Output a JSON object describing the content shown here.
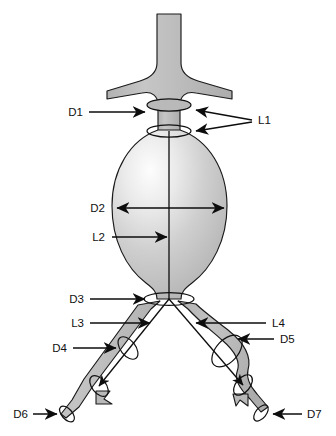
{
  "figure": {
    "background_color": "#ffffff",
    "vessel_fill_color": "#b9b9b9",
    "vessel_outline_color": "#1a1a1a",
    "highlight_color": "#fdfdfd",
    "annotation_color": "#0d0d0d"
  },
  "labels": {
    "d1": "D1",
    "d2": "D2",
    "d3": "D3",
    "d4": "D4",
    "d5": "D5",
    "d6": "D6",
    "d7": "D7",
    "l1": "L1",
    "l2": "L2",
    "l3": "L3",
    "l4": "L4"
  },
  "annotations": [
    {
      "id": "D1",
      "kind": "diameter",
      "arrow": "single",
      "direction": "right",
      "target": "proximal-aortic-neck"
    },
    {
      "id": "L1",
      "kind": "length",
      "arrow": "double-branch",
      "direction": "left",
      "target": "aortic-neck-segment"
    },
    {
      "id": "D2",
      "kind": "diameter",
      "arrow": "double",
      "direction": "horizontal",
      "target": "aneurysm-sac-max-diameter"
    },
    {
      "id": "L2",
      "kind": "length",
      "arrow": "single",
      "direction": "right",
      "target": "aneurysm-sac-centerline"
    },
    {
      "id": "D3",
      "kind": "diameter",
      "arrow": "single",
      "direction": "right",
      "target": "distal-aortic-bifurcation"
    },
    {
      "id": "L3",
      "kind": "length",
      "arrow": "single",
      "direction": "right",
      "target": "left-iliac-limb-length"
    },
    {
      "id": "L4",
      "kind": "length",
      "arrow": "single",
      "direction": "left",
      "target": "right-iliac-limb-length"
    },
    {
      "id": "D4",
      "kind": "diameter",
      "arrow": "single",
      "direction": "right",
      "target": "left-common-iliac-artery"
    },
    {
      "id": "D5",
      "kind": "diameter",
      "arrow": "single",
      "direction": "left",
      "target": "right-common-iliac-aneurysm"
    },
    {
      "id": "D6",
      "kind": "diameter",
      "arrow": "single",
      "direction": "right",
      "target": "left-distal-iliac-landing-zone"
    },
    {
      "id": "D7",
      "kind": "diameter",
      "arrow": "single",
      "direction": "left",
      "target": "right-distal-iliac-landing-zone"
    }
  ]
}
